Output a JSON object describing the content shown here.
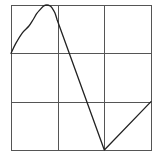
{
  "chart_data": {
    "type": "line",
    "title": "",
    "xlabel": "",
    "ylabel": "",
    "xlim": [
      0,
      3
    ],
    "ylim": [
      0,
      3
    ],
    "grid": true,
    "grid_divisions": {
      "x": 3,
      "y": 3
    },
    "legend": null,
    "tick_labels": {
      "x": [],
      "y": []
    },
    "series": [
      {
        "name": "curve",
        "color": "#222222",
        "x": [
          0.0,
          0.1,
          0.24,
          0.38,
          0.47,
          0.55,
          0.62,
          0.7,
          0.77,
          0.84,
          0.88,
          0.94,
          0.99,
          2.0,
          3.0
        ],
        "y": [
          2.0,
          2.2,
          2.42,
          2.56,
          2.69,
          2.82,
          2.9,
          2.98,
          3.0,
          2.98,
          2.94,
          2.84,
          2.69,
          0.0,
          1.0
        ]
      }
    ]
  },
  "colors": {
    "background": "#ffffff",
    "grid": "#555555",
    "line": "#222222"
  }
}
